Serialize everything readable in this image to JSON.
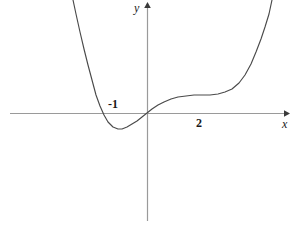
{
  "chart_data": {
    "type": "line",
    "title": "",
    "subtitle": "",
    "xlabel": "x",
    "ylabel": "y",
    "grid": false,
    "legend": null,
    "axes": {
      "x_axis": {
        "label": "x",
        "arrow": true,
        "tick_labels": [
          "-1",
          "2"
        ],
        "tick_values": [
          -1,
          2
        ]
      },
      "y_axis": {
        "label": "y",
        "arrow": true,
        "tick_labels": [],
        "tick_values": []
      }
    },
    "annotations": [
      {
        "text": "−1",
        "x": -1,
        "note": "label placed above x-axis, left of origin"
      },
      {
        "text": "2",
        "x": 2,
        "note": "label placed below x-axis, right of origin"
      },
      {
        "text": "y",
        "note": "y-axis name at top of vertical axis"
      },
      {
        "text": "x",
        "note": "x-axis name at right end of horizontal axis"
      }
    ],
    "series": [
      {
        "name": "curve",
        "description": "quartic-like polynomial: steep descent on the left, local minimum between -1 and 0, passes through the origin, rises to a flat plateau / inflection near x = 2, then rises steeply",
        "points": [
          [
            73,
            0
          ],
          [
            76,
            14
          ],
          [
            80,
            32
          ],
          [
            84,
            49
          ],
          [
            88,
            65
          ],
          [
            92,
            80
          ],
          [
            96,
            95
          ],
          [
            100,
            106
          ],
          [
            104,
            115
          ],
          [
            108,
            122
          ],
          [
            113,
            127
          ],
          [
            118,
            129
          ],
          [
            122,
            129
          ],
          [
            127,
            127
          ],
          [
            132,
            124
          ],
          [
            137,
            121
          ],
          [
            142,
            117
          ],
          [
            147,
            113
          ],
          [
            152,
            109
          ],
          [
            158,
            105
          ],
          [
            164,
            102
          ],
          [
            171,
            99
          ],
          [
            178,
            97
          ],
          [
            186,
            96
          ],
          [
            194,
            95
          ],
          [
            202,
            95
          ],
          [
            210,
            95
          ],
          [
            218,
            94
          ],
          [
            225,
            92
          ],
          [
            232,
            89
          ],
          [
            239,
            83
          ],
          [
            245,
            75
          ],
          [
            251,
            64
          ],
          [
            256,
            52
          ],
          [
            261,
            39
          ],
          [
            265,
            27
          ],
          [
            269,
            14
          ],
          [
            272,
            0
          ]
        ]
      }
    ],
    "features": {
      "local_minimum_x": -1,
      "root_at_origin": 0,
      "plateau_near_x": 2
    }
  },
  "style": {
    "curve_color": "#4a4a4a",
    "axis_color": "#9a9a9a",
    "text_color": "#1a1a1a",
    "background": "#ffffff"
  }
}
